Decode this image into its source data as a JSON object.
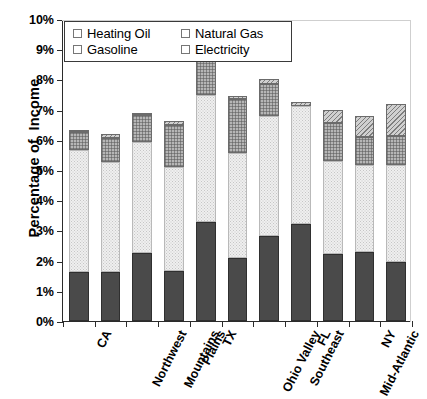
{
  "chart_data": {
    "type": "bar",
    "subtype": "stacked-vertical",
    "title": "",
    "xlabel": "",
    "ylabel": "Percentage of  Income",
    "ylim": [
      0,
      10
    ],
    "ytick_step": 1,
    "ytick_labels": [
      "0%",
      "1%",
      "2%",
      "3%",
      "4%",
      "5%",
      "6%",
      "7%",
      "8%",
      "9%",
      "10%"
    ],
    "grid": false,
    "legend_position": "top-left-inside",
    "value_unit": "percent",
    "categories": [
      "CA",
      "Northwest",
      "Mountains",
      "Plains",
      "TX",
      "Ohio Valley",
      "Southeast",
      "FL",
      "Mid-Atlantic",
      "NY",
      "Northeast"
    ],
    "series": [
      {
        "name": "Electricity",
        "order": 0,
        "color": "#4a4a4a",
        "pattern": "solid-dark",
        "values": [
          1.62,
          1.62,
          2.25,
          1.67,
          3.27,
          2.1,
          2.83,
          3.2,
          2.22,
          2.27,
          1.94
        ]
      },
      {
        "name": "Gasoline",
        "order": 1,
        "color": "#efefef",
        "pattern": "fine-dots",
        "values": [
          4.03,
          3.65,
          3.68,
          3.43,
          4.23,
          3.47,
          3.97,
          3.91,
          3.08,
          2.88,
          3.22
        ]
      },
      {
        "name": "Natural Gas",
        "order": 2,
        "color": "#b6b6b6",
        "pattern": "cross-hatch",
        "values": [
          0.62,
          0.78,
          0.88,
          1.4,
          1.9,
          1.77,
          1.05,
          0.0,
          1.25,
          0.95,
          0.95
        ]
      },
      {
        "name": "Heating Oil",
        "order": 3,
        "color": "#d0d0d0",
        "pattern": "diagonal-hatch",
        "values": [
          0.05,
          0.15,
          0.07,
          0.13,
          0.12,
          0.1,
          0.15,
          0.14,
          0.45,
          0.7,
          1.09
        ]
      }
    ],
    "totals": [
      6.32,
      6.2,
      6.88,
      6.63,
      9.52,
      7.44,
      8.0,
      7.25,
      7.0,
      6.8,
      7.2
    ]
  },
  "legend": {
    "items": [
      {
        "label": "Heating Oil",
        "key": "heating-oil"
      },
      {
        "label": "Natural Gas",
        "key": "natural-gas"
      },
      {
        "label": "Gasoline",
        "key": "gasoline"
      },
      {
        "label": "Electricity",
        "key": "electricity"
      }
    ]
  }
}
